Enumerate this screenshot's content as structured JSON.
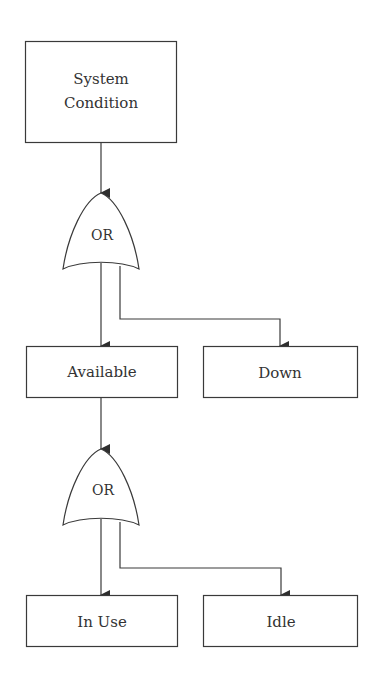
{
  "diagram": {
    "type": "fault-tree",
    "nodes": {
      "root": {
        "label_line1": "System",
        "label_line2": "Condition"
      },
      "available": {
        "label": "Available"
      },
      "down": {
        "label": "Down"
      },
      "in_use": {
        "label": "In Use"
      },
      "idle": {
        "label": "Idle"
      }
    },
    "gates": [
      {
        "id": "gate-1",
        "label": "OR",
        "input": "System Condition",
        "outputs": [
          "Available",
          "Down"
        ]
      },
      {
        "id": "gate-2",
        "label": "OR",
        "input": "Available",
        "outputs": [
          "In Use",
          "Idle"
        ]
      }
    ],
    "edges": [
      {
        "from": "System Condition",
        "to": "gate-1"
      },
      {
        "from": "gate-1",
        "to": "Available"
      },
      {
        "from": "gate-1",
        "to": "Down"
      },
      {
        "from": "Available",
        "to": "gate-2"
      },
      {
        "from": "gate-2",
        "to": "In Use"
      },
      {
        "from": "gate-2",
        "to": "Idle"
      }
    ]
  }
}
